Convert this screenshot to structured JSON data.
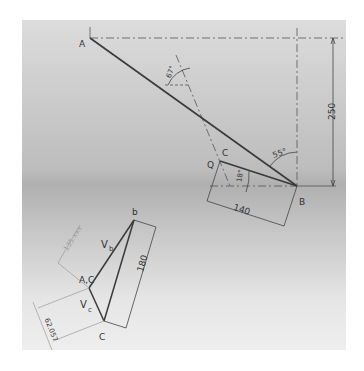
{
  "diagram": {
    "mechanism": {
      "points": {
        "A": "A",
        "B": "B",
        "C": "C",
        "Q": "Q"
      },
      "dimensions": {
        "vertical_AB": "250",
        "link_length": "140",
        "angle_at_B": "55°",
        "angle_at_C": "18°",
        "angle_construction": "67°"
      }
    },
    "velocity_polygon": {
      "points": {
        "b": "b",
        "ac": "A,C",
        "c": "C"
      },
      "vectors": {
        "vb": "V",
        "vb_sub": "b",
        "vc": "V",
        "vc_sub": "c"
      },
      "dimensions": {
        "bc_length": "180",
        "vc_length": "62.057",
        "vb_length": "135.xxx"
      }
    },
    "colors": {
      "line": "#3a3a3a",
      "construction": "#5a5a5a",
      "faint": "#9a9a9a"
    }
  }
}
